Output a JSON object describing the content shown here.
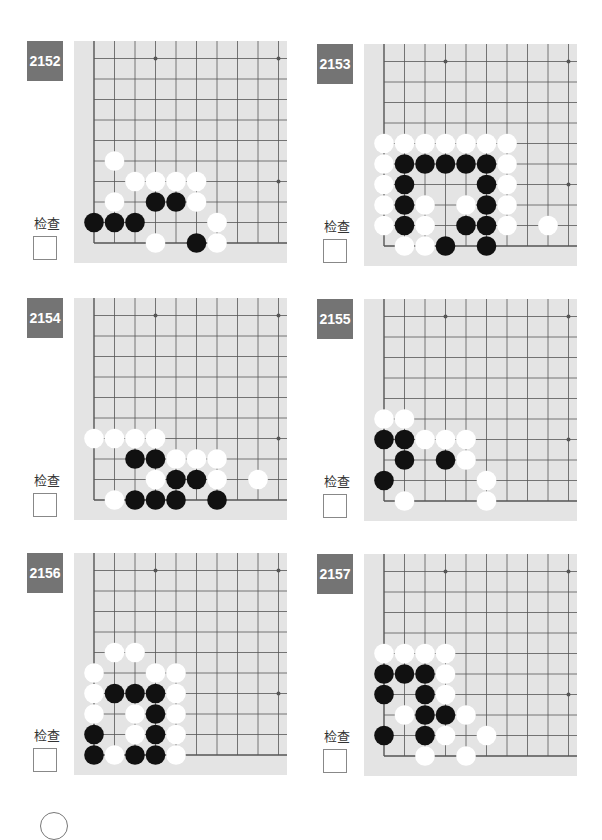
{
  "page": {
    "check_label": "检查"
  },
  "colors": {
    "badge_bg": "#747474",
    "board_bg": "#e4e4e4",
    "grid_line": "#555555",
    "black_stone": "#111111",
    "white_stone": "#ffffff"
  },
  "problems": [
    {
      "number": "2152",
      "black": [
        [
          3,
          2
        ],
        [
          4,
          2
        ],
        [
          0,
          1
        ],
        [
          1,
          1
        ],
        [
          2,
          1
        ],
        [
          5,
          0
        ]
      ],
      "white": [
        [
          1,
          4
        ],
        [
          2,
          3
        ],
        [
          3,
          3
        ],
        [
          4,
          3
        ],
        [
          5,
          3
        ],
        [
          1,
          2
        ],
        [
          5,
          2
        ],
        [
          6,
          1
        ],
        [
          3,
          0
        ],
        [
          6,
          0
        ]
      ]
    },
    {
      "number": "2153",
      "black": [
        [
          1,
          4
        ],
        [
          2,
          4
        ],
        [
          3,
          4
        ],
        [
          4,
          4
        ],
        [
          5,
          4
        ],
        [
          1,
          3
        ],
        [
          5,
          3
        ],
        [
          1,
          2
        ],
        [
          5,
          2
        ],
        [
          1,
          1
        ],
        [
          4,
          1
        ],
        [
          5,
          1
        ],
        [
          3,
          0
        ],
        [
          5,
          0
        ]
      ],
      "white": [
        [
          0,
          5
        ],
        [
          1,
          5
        ],
        [
          2,
          5
        ],
        [
          3,
          5
        ],
        [
          4,
          5
        ],
        [
          5,
          5
        ],
        [
          6,
          5
        ],
        [
          0,
          4
        ],
        [
          6,
          4
        ],
        [
          0,
          3
        ],
        [
          6,
          3
        ],
        [
          0,
          2
        ],
        [
          2,
          2
        ],
        [
          4,
          2
        ],
        [
          6,
          2
        ],
        [
          0,
          1
        ],
        [
          2,
          1
        ],
        [
          6,
          1
        ],
        [
          8,
          1
        ],
        [
          1,
          0
        ],
        [
          2,
          0
        ]
      ]
    },
    {
      "number": "2154",
      "black": [
        [
          2,
          2
        ],
        [
          3,
          2
        ],
        [
          4,
          1
        ],
        [
          5,
          1
        ],
        [
          2,
          0
        ],
        [
          3,
          0
        ],
        [
          4,
          0
        ],
        [
          6,
          0
        ]
      ],
      "white": [
        [
          0,
          3
        ],
        [
          1,
          3
        ],
        [
          2,
          3
        ],
        [
          3,
          3
        ],
        [
          4,
          2
        ],
        [
          5,
          2
        ],
        [
          6,
          2
        ],
        [
          3,
          1
        ],
        [
          6,
          1
        ],
        [
          8,
          1
        ],
        [
          1,
          0
        ]
      ]
    },
    {
      "number": "2155",
      "black": [
        [
          0,
          3
        ],
        [
          1,
          3
        ],
        [
          1,
          2
        ],
        [
          3,
          2
        ],
        [
          0,
          1
        ]
      ],
      "white": [
        [
          0,
          4
        ],
        [
          1,
          4
        ],
        [
          2,
          3
        ],
        [
          3,
          3
        ],
        [
          4,
          3
        ],
        [
          4,
          2
        ],
        [
          5,
          1
        ],
        [
          1,
          0
        ],
        [
          5,
          0
        ]
      ]
    },
    {
      "number": "2156",
      "black": [
        [
          1,
          3
        ],
        [
          2,
          3
        ],
        [
          3,
          3
        ],
        [
          3,
          2
        ],
        [
          0,
          1
        ],
        [
          3,
          1
        ],
        [
          0,
          0
        ],
        [
          2,
          0
        ],
        [
          3,
          0
        ]
      ],
      "white": [
        [
          1,
          5
        ],
        [
          2,
          5
        ],
        [
          0,
          4
        ],
        [
          3,
          4
        ],
        [
          4,
          4
        ],
        [
          0,
          3
        ],
        [
          4,
          3
        ],
        [
          0,
          2
        ],
        [
          2,
          2
        ],
        [
          4,
          2
        ],
        [
          2,
          1
        ],
        [
          4,
          1
        ],
        [
          1,
          0
        ],
        [
          4,
          0
        ]
      ]
    },
    {
      "number": "2157",
      "black": [
        [
          0,
          4
        ],
        [
          1,
          4
        ],
        [
          2,
          4
        ],
        [
          0,
          3
        ],
        [
          2,
          3
        ],
        [
          2,
          2
        ],
        [
          3,
          2
        ],
        [
          0,
          1
        ],
        [
          2,
          1
        ]
      ],
      "white": [
        [
          0,
          5
        ],
        [
          1,
          5
        ],
        [
          2,
          5
        ],
        [
          3,
          5
        ],
        [
          3,
          4
        ],
        [
          3,
          3
        ],
        [
          1,
          2
        ],
        [
          4,
          2
        ],
        [
          3,
          1
        ],
        [
          5,
          1
        ],
        [
          2,
          0
        ],
        [
          4,
          0
        ]
      ]
    }
  ]
}
